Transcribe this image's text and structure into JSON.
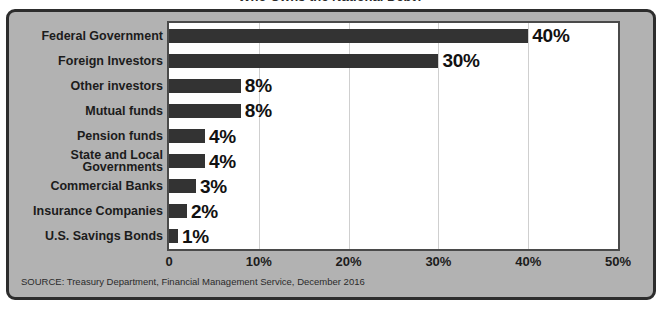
{
  "chart_data": {
    "type": "bar",
    "orientation": "horizontal",
    "title": "Who Owns the National Debt?",
    "categories": [
      "Federal Government",
      "Foreign Investors",
      "Other investors",
      "Mutual funds",
      "Pension funds",
      "State and Local Governments",
      "Commercial Banks",
      "Insurance Companies",
      "U.S. Savings Bonds"
    ],
    "values": [
      40,
      30,
      8,
      8,
      4,
      4,
      3,
      2,
      1
    ],
    "data_labels": [
      "40%",
      "30%",
      "8%",
      "8%",
      "4%",
      "4%",
      "3%",
      "2%",
      "1%"
    ],
    "xlabel": "",
    "ylabel": "",
    "xlim": [
      0,
      50
    ],
    "xticks": [
      0,
      10,
      20,
      30,
      40,
      50
    ],
    "xtick_labels": [
      "0",
      "10%",
      "20%",
      "30%",
      "40%",
      "50%"
    ],
    "grid": true,
    "legend": false,
    "bar_color": "#333333",
    "plot_background": "#ffffff",
    "panel_background": "#b2b2b2"
  },
  "source_note": "SOURCE: Treasury Department, Financial Management Service, December 2016",
  "category_label_lines": [
    [
      "Federal Government"
    ],
    [
      "Foreign Investors"
    ],
    [
      "Other investors"
    ],
    [
      "Mutual funds"
    ],
    [
      "Pension funds"
    ],
    [
      "State and Local",
      "Governments"
    ],
    [
      "Commercial Banks"
    ],
    [
      "Insurance Companies"
    ],
    [
      "U.S. Savings Bonds"
    ]
  ]
}
